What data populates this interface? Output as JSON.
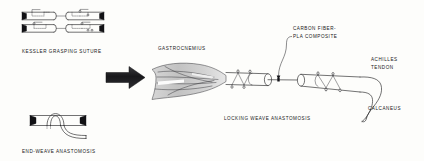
{
  "figure": {
    "background_color": "#fdfdfb",
    "ink_color": "#1b1b1e",
    "muscle_fill_color": "#c9c9c9"
  },
  "panels": {
    "kessler": {
      "caption": "KESSLER GRASPING SUTURE",
      "rows": 2,
      "segments_per_row": 2
    },
    "endweave": {
      "caption": "END-WEAVE ANASTOMOSIS"
    },
    "main": {
      "caption": "LOCKING WEAVE ANASTOMOSIS",
      "labels": {
        "gastrocnemius": "GASTROCNEMIUS",
        "graft_line1": "CARBON FIBER-",
        "graft_line2": "PLA COMPOSITE",
        "achilles_line1": "ACHILLES",
        "achilles_line2": "TENDON",
        "calcaneus": "CALCANEUS"
      }
    }
  },
  "arrow": {
    "name": "process-arrow",
    "direction": "right",
    "color": "#141417"
  }
}
